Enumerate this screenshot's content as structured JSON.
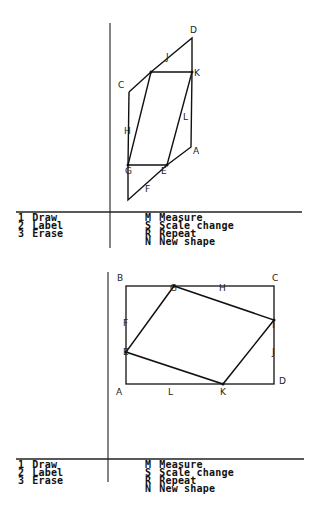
{
  "panels": [
    {
      "shape_name": "parallelogram-in-parallelogram",
      "vertex_labels": [
        "A",
        "C",
        "D",
        "E",
        "F",
        "G",
        "H",
        "J",
        "K",
        "L"
      ],
      "menu_left": [
        {
          "key": "1",
          "label": "Draw"
        },
        {
          "key": "2",
          "label": "Label"
        },
        {
          "key": "3",
          "label": "Erase"
        }
      ],
      "menu_right": [
        {
          "key": "M",
          "label": "Measure"
        },
        {
          "key": "S",
          "label": "Scale change"
        },
        {
          "key": "R",
          "label": "Repeat"
        },
        {
          "key": "N",
          "label": "New shape"
        }
      ]
    },
    {
      "shape_name": "parallelogram-in-rectangle",
      "vertex_labels": [
        "A",
        "B",
        "C",
        "D",
        "E",
        "F",
        "G",
        "H",
        "I",
        "J",
        "K",
        "L"
      ],
      "menu_left": [
        {
          "key": "1",
          "label": "Draw"
        },
        {
          "key": "2",
          "label": "Label"
        },
        {
          "key": "3",
          "label": "Erase"
        }
      ],
      "menu_right": [
        {
          "key": "M",
          "label": "Measure"
        },
        {
          "key": "S",
          "label": "Scale change"
        },
        {
          "key": "R",
          "label": "Repeat"
        },
        {
          "key": "N",
          "label": "New shape"
        }
      ]
    }
  ],
  "labels1": {
    "A": "A",
    "C": "C",
    "D": "D",
    "E": "E",
    "F": "F",
    "G": "G",
    "H": "H",
    "J": "J",
    "K": "K",
    "L": "L"
  },
  "labels2": {
    "A": "A",
    "B": "B",
    "C": "C",
    "D": "D",
    "E": "E",
    "F": "F",
    "G": "G",
    "H": "H",
    "I": "I",
    "J": "J",
    "K": "K",
    "L": "L"
  }
}
